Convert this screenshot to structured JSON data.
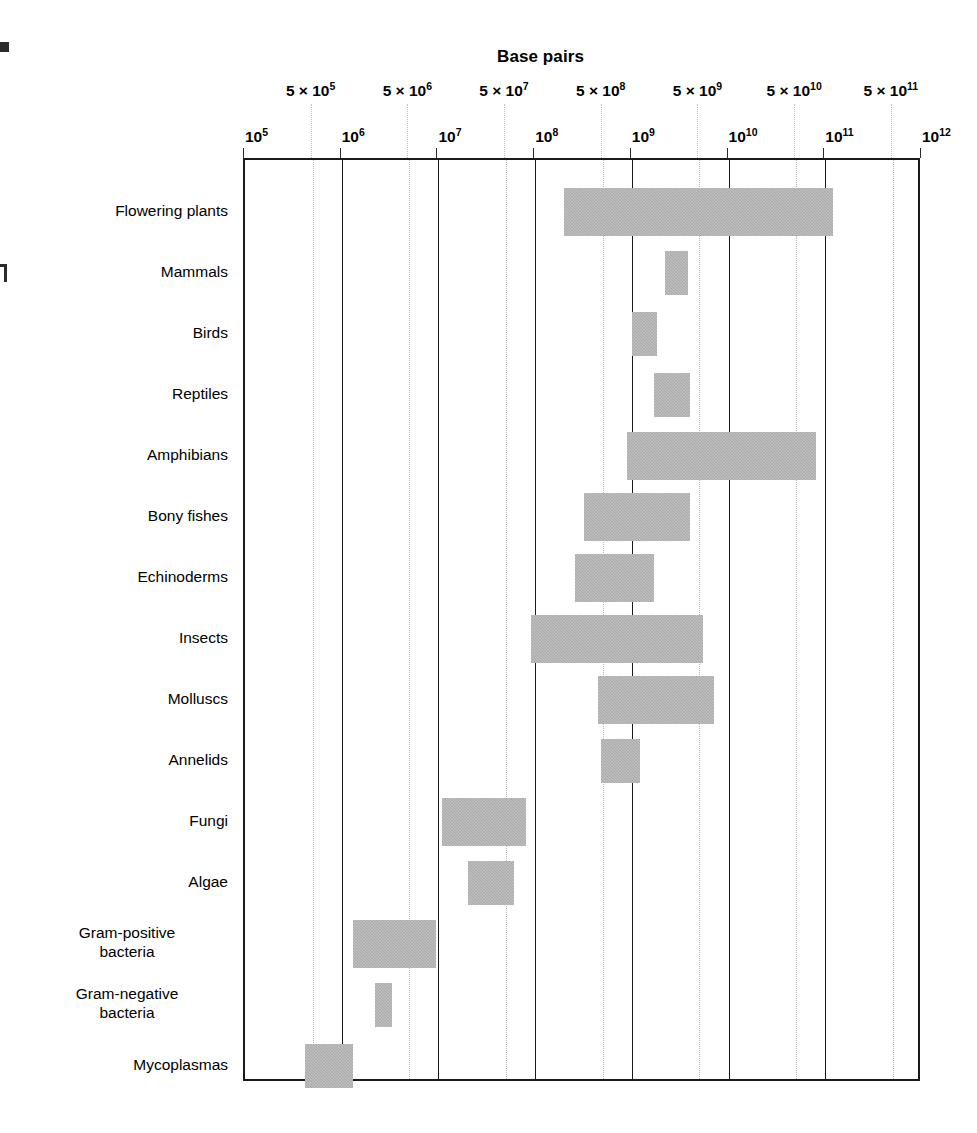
{
  "chart_data": {
    "type": "bar",
    "orientation": "horizontal",
    "title": "Base pairs",
    "xlabel": "Base pairs",
    "ylabel": "",
    "xscale": "log",
    "xlim": [
      100000,
      1000000000000
    ],
    "grid": "vertical major solid at decades, minor dotted at 5x decades",
    "legend": "none",
    "value_unit": "base pairs",
    "note": "Horizontal floating bars show genome-size ranges (min to max base pairs) per organism group.",
    "categories": [
      "Flowering plants",
      "Mammals",
      "Birds",
      "Reptiles",
      "Amphibians",
      "Bony fishes",
      "Echinoderms",
      "Insects",
      "Molluscs",
      "Annelids",
      "Fungi",
      "Algae",
      "Gram-positive bacteria",
      "Gram-negative bacteria",
      "Mycoplasmas"
    ],
    "ranges": [
      {
        "label": "Flowering plants",
        "low": 200000000.0,
        "high": 120000000000.0
      },
      {
        "label": "Mammals",
        "low": 2200000000.0,
        "high": 3800000000.0
      },
      {
        "label": "Birds",
        "low": 1000000000.0,
        "high": 1800000000.0
      },
      {
        "label": "Reptiles",
        "low": 1700000000.0,
        "high": 4000000000.0
      },
      {
        "label": "Amphibians",
        "low": 900000000.0,
        "high": 80000000000.0
      },
      {
        "label": "Bony fishes",
        "low": 320000000.0,
        "high": 4000000000.0
      },
      {
        "label": "Echinoderms",
        "low": 260000000.0,
        "high": 1700000000.0
      },
      {
        "label": "Insects",
        "low": 90000000.0,
        "high": 5500000000.0
      },
      {
        "label": "Molluscs",
        "low": 450000000.0,
        "high": 7000000000.0
      },
      {
        "label": "Annelids",
        "low": 480000000.0,
        "high": 1200000000.0
      },
      {
        "label": "Fungi",
        "low": 11000000.0,
        "high": 80000000.0
      },
      {
        "label": "Algae",
        "low": 20000000.0,
        "high": 60000000.0
      },
      {
        "label": "Gram-positive bacteria",
        "low": 1300000.0,
        "high": 9500000.0
      },
      {
        "label": "Gram-negative bacteria",
        "low": 2200000.0,
        "high": 3300000.0
      },
      {
        "label": "Mycoplasmas",
        "low": 420000.0,
        "high": 1300000.0
      }
    ],
    "decade_ticks": [
      {
        "exp": 5,
        "mantissa": "10",
        "label": "10⁵"
      },
      {
        "exp": 6,
        "mantissa": "10",
        "label": "10⁶"
      },
      {
        "exp": 7,
        "mantissa": "10",
        "label": "10⁷"
      },
      {
        "exp": 8,
        "mantissa": "10",
        "label": "10⁸"
      },
      {
        "exp": 9,
        "mantissa": "10",
        "label": "10⁹"
      },
      {
        "exp": 10,
        "mantissa": "10",
        "label": "10¹⁰"
      },
      {
        "exp": 11,
        "mantissa": "10",
        "label": "10¹¹"
      },
      {
        "exp": 12,
        "mantissa": "10",
        "label": "10¹²"
      }
    ],
    "half_decade_ticks": [
      {
        "exp": 5,
        "label": "5 × 10⁵"
      },
      {
        "exp": 6,
        "label": "5 × 10⁶"
      },
      {
        "exp": 7,
        "label": "5 × 10⁷"
      },
      {
        "exp": 8,
        "label": "5 × 10⁸"
      },
      {
        "exp": 9,
        "label": "5 × 10⁹"
      },
      {
        "exp": 10,
        "label": "5 × 10¹⁰"
      },
      {
        "exp": 11,
        "label": "5 × 10¹¹"
      }
    ]
  },
  "colors": {
    "bar_fill": "#a9a9a9",
    "axis": "#1a1a1a",
    "gridline_major": "#1a1a1a",
    "gridline_minor": "#b9b9b9",
    "background": "#ffffff",
    "text": "#000000"
  }
}
